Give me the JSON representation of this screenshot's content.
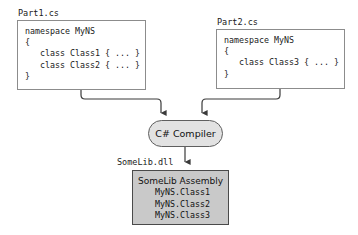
{
  "diagram": {
    "colors": {
      "background": "#ffffff",
      "box_border": "#8c8c8c",
      "compiler_fill": "#e2e2e2",
      "compiler_border": "#5f5f5f",
      "assembly_fill": "#c9c9c9",
      "assembly_border": "#4a4a4a",
      "wire": "#3a3a3a",
      "text": "#111111"
    },
    "sources": [
      {
        "filename": "Part1.cs",
        "code": "namespace MyNS\n{\n   class Class1 { ... }\n   class Class2 { ... }\n}"
      },
      {
        "filename": "Part2.cs",
        "code": "namespace MyNS\n{\n   class Class3 { ... }\n}"
      }
    ],
    "compiler": {
      "label": "C# Compiler"
    },
    "output": {
      "file_label": "SomeLib.dll",
      "assembly_title": "SomeLib Assembly",
      "members": [
        "MyNS.Class1",
        "MyNS.Class2",
        "MyNS.Class3"
      ]
    }
  }
}
